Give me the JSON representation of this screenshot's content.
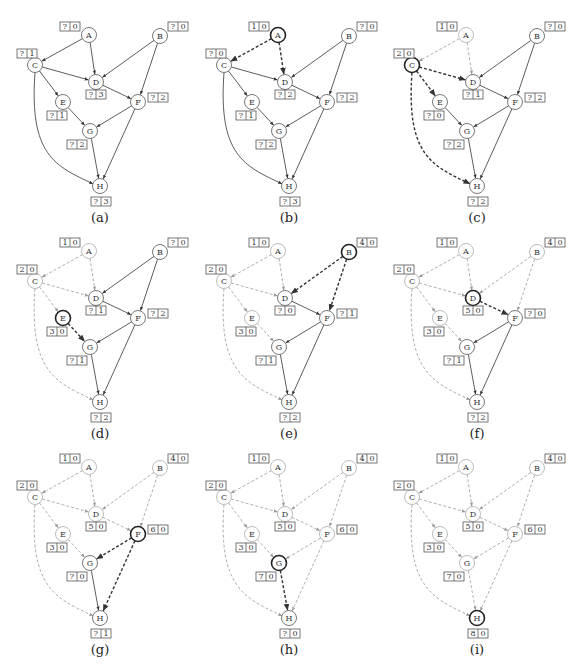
{
  "figure": {
    "colors": {
      "unvisited_edge": "#333333",
      "active_edge": "#333333",
      "visited_edge": "#9a9a9a",
      "node_normal": "#555555",
      "node_active": "#222222",
      "node_visited": "#aaaaaa",
      "box_border": "#555555"
    }
  },
  "graph": {
    "nodes": [
      {
        "id": "A",
        "x": 89,
        "y": 35,
        "box": {
          "x": 60,
          "y": 22
        }
      },
      {
        "id": "B",
        "x": 160,
        "y": 36,
        "box": {
          "x": 168,
          "y": 22
        }
      },
      {
        "id": "C",
        "x": 35,
        "y": 65,
        "box": {
          "x": 17,
          "y": 49
        }
      },
      {
        "id": "D",
        "x": 96,
        "y": 82,
        "box": {
          "x": 86,
          "y": 90
        }
      },
      {
        "id": "E",
        "x": 63,
        "y": 102,
        "box": {
          "x": 47,
          "y": 111
        }
      },
      {
        "id": "F",
        "x": 138,
        "y": 102,
        "box": {
          "x": 148,
          "y": 93
        }
      },
      {
        "id": "G",
        "x": 90,
        "y": 131,
        "box": {
          "x": 67,
          "y": 140
        }
      },
      {
        "id": "H",
        "x": 100,
        "y": 186,
        "box": {
          "x": 91,
          "y": 197
        }
      }
    ],
    "edges": [
      {
        "from": "A",
        "to": "C"
      },
      {
        "from": "A",
        "to": "D"
      },
      {
        "from": "B",
        "to": "D"
      },
      {
        "from": "B",
        "to": "F"
      },
      {
        "from": "C",
        "to": "D"
      },
      {
        "from": "C",
        "to": "E"
      },
      {
        "from": "C",
        "to": "H",
        "curve": true
      },
      {
        "from": "D",
        "to": "F"
      },
      {
        "from": "E",
        "to": "G"
      },
      {
        "from": "F",
        "to": "G"
      },
      {
        "from": "F",
        "to": "H"
      },
      {
        "from": "G",
        "to": "H"
      }
    ]
  },
  "panels": [
    {
      "caption": "(a)",
      "offset": {
        "x": 0,
        "y": 0
      },
      "active": null,
      "visited_nodes": [],
      "active_edges": [],
      "visited_edges": [],
      "labels": {
        "A": [
          "?",
          "0"
        ],
        "B": [
          "?",
          "0"
        ],
        "C": [
          "?",
          "1"
        ],
        "D": [
          "?",
          "3"
        ],
        "E": [
          "?",
          "1"
        ],
        "F": [
          "?",
          "2"
        ],
        "G": [
          "?",
          "2"
        ],
        "H": [
          "?",
          "3"
        ]
      }
    },
    {
      "caption": "(b)",
      "offset": {
        "x": 189,
        "y": 0
      },
      "active": "A",
      "visited_nodes": [],
      "active_edges": [
        "A-C",
        "A-D"
      ],
      "visited_edges": [],
      "labels": {
        "A": [
          "1",
          "0"
        ],
        "B": [
          "?",
          "0"
        ],
        "C": [
          "?",
          "0"
        ],
        "D": [
          "?",
          "2"
        ],
        "E": [
          "?",
          "1"
        ],
        "F": [
          "?",
          "2"
        ],
        "G": [
          "?",
          "2"
        ],
        "H": [
          "?",
          "3"
        ]
      }
    },
    {
      "caption": "(c)",
      "offset": {
        "x": 377,
        "y": 0
      },
      "active": "C",
      "visited_nodes": [
        "A"
      ],
      "active_edges": [
        "C-D",
        "C-E",
        "C-H"
      ],
      "visited_edges": [
        "A-C",
        "A-D"
      ],
      "labels": {
        "A": [
          "1",
          "0"
        ],
        "B": [
          "?",
          "0"
        ],
        "C": [
          "2",
          "0"
        ],
        "D": [
          "?",
          "1"
        ],
        "E": [
          "?",
          "0"
        ],
        "F": [
          "?",
          "2"
        ],
        "G": [
          "?",
          "2"
        ],
        "H": [
          "?",
          "2"
        ]
      }
    },
    {
      "caption": "(d)",
      "offset": {
        "x": 0,
        "y": 216
      },
      "active": "E",
      "visited_nodes": [
        "A",
        "C"
      ],
      "active_edges": [
        "E-G"
      ],
      "visited_edges": [
        "A-C",
        "A-D",
        "C-D",
        "C-E",
        "C-H"
      ],
      "labels": {
        "A": [
          "1",
          "0"
        ],
        "B": [
          "?",
          "0"
        ],
        "C": [
          "2",
          "0"
        ],
        "D": [
          "?",
          "1"
        ],
        "E": [
          "3",
          "0"
        ],
        "F": [
          "?",
          "2"
        ],
        "G": [
          "?",
          "1"
        ],
        "H": [
          "?",
          "2"
        ]
      }
    },
    {
      "caption": "(e)",
      "offset": {
        "x": 189,
        "y": 216
      },
      "active": "B",
      "visited_nodes": [
        "A",
        "C",
        "E"
      ],
      "active_edges": [
        "B-D",
        "B-F"
      ],
      "visited_edges": [
        "A-C",
        "A-D",
        "C-D",
        "C-E",
        "C-H",
        "E-G"
      ],
      "labels": {
        "A": [
          "1",
          "0"
        ],
        "B": [
          "4",
          "0"
        ],
        "C": [
          "2",
          "0"
        ],
        "D": [
          "?",
          "0"
        ],
        "E": [
          "3",
          "0"
        ],
        "F": [
          "?",
          "1"
        ],
        "G": [
          "?",
          "1"
        ],
        "H": [
          "?",
          "2"
        ]
      }
    },
    {
      "caption": "(f)",
      "offset": {
        "x": 377,
        "y": 216
      },
      "active": "D",
      "visited_nodes": [
        "A",
        "B",
        "C",
        "E"
      ],
      "active_edges": [
        "D-F"
      ],
      "visited_edges": [
        "A-C",
        "A-D",
        "C-D",
        "C-E",
        "C-H",
        "E-G",
        "B-D",
        "B-F"
      ],
      "labels": {
        "A": [
          "1",
          "0"
        ],
        "B": [
          "4",
          "0"
        ],
        "C": [
          "2",
          "0"
        ],
        "D": [
          "5",
          "0"
        ],
        "E": [
          "3",
          "0"
        ],
        "F": [
          "?",
          "0"
        ],
        "G": [
          "?",
          "1"
        ],
        "H": [
          "?",
          "2"
        ]
      }
    },
    {
      "caption": "(g)",
      "offset": {
        "x": 0,
        "y": 432
      },
      "active": "F",
      "visited_nodes": [
        "A",
        "B",
        "C",
        "D",
        "E"
      ],
      "active_edges": [
        "F-G",
        "F-H"
      ],
      "visited_edges": [
        "A-C",
        "A-D",
        "C-D",
        "C-E",
        "C-H",
        "E-G",
        "B-D",
        "B-F",
        "D-F"
      ],
      "labels": {
        "A": [
          "1",
          "0"
        ],
        "B": [
          "4",
          "0"
        ],
        "C": [
          "2",
          "0"
        ],
        "D": [
          "5",
          "0"
        ],
        "E": [
          "3",
          "0"
        ],
        "F": [
          "6",
          "0"
        ],
        "G": [
          "?",
          "0"
        ],
        "H": [
          "?",
          "1"
        ]
      }
    },
    {
      "caption": "(h)",
      "offset": {
        "x": 189,
        "y": 432
      },
      "active": "G",
      "visited_nodes": [
        "A",
        "B",
        "C",
        "D",
        "E",
        "F"
      ],
      "active_edges": [
        "G-H"
      ],
      "visited_edges": [
        "A-C",
        "A-D",
        "C-D",
        "C-E",
        "C-H",
        "E-G",
        "B-D",
        "B-F",
        "D-F",
        "F-G",
        "F-H"
      ],
      "labels": {
        "A": [
          "1",
          "0"
        ],
        "B": [
          "4",
          "0"
        ],
        "C": [
          "2",
          "0"
        ],
        "D": [
          "5",
          "0"
        ],
        "E": [
          "3",
          "0"
        ],
        "F": [
          "6",
          "0"
        ],
        "G": [
          "7",
          "0"
        ],
        "H": [
          "?",
          "0"
        ]
      }
    },
    {
      "caption": "(i)",
      "offset": {
        "x": 377,
        "y": 432
      },
      "active": "H",
      "visited_nodes": [
        "A",
        "B",
        "C",
        "D",
        "E",
        "F",
        "G"
      ],
      "active_edges": [],
      "visited_edges": [
        "A-C",
        "A-D",
        "C-D",
        "C-E",
        "C-H",
        "E-G",
        "B-D",
        "B-F",
        "D-F",
        "F-G",
        "F-H",
        "G-H"
      ],
      "labels": {
        "A": [
          "1",
          "0"
        ],
        "B": [
          "4",
          "0"
        ],
        "C": [
          "2",
          "0"
        ],
        "D": [
          "5",
          "0"
        ],
        "E": [
          "3",
          "0"
        ],
        "F": [
          "6",
          "0"
        ],
        "G": [
          "7",
          "0"
        ],
        "H": [
          "8",
          "0"
        ]
      }
    }
  ]
}
